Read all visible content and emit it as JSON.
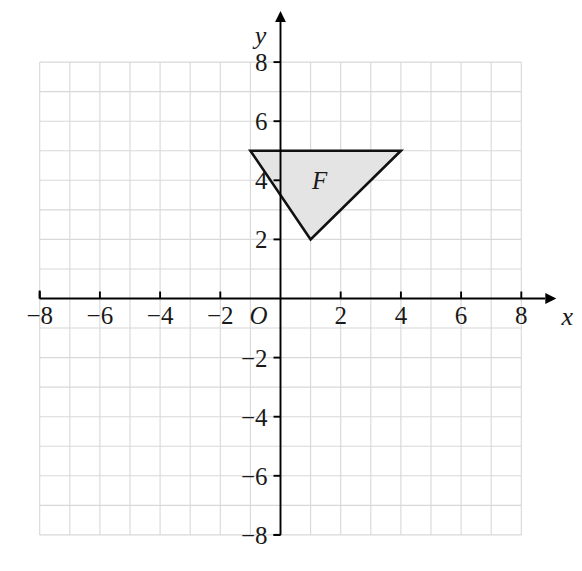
{
  "figure": {
    "title": "",
    "background_color": "#ffffff"
  },
  "chart_data": {
    "type": "scatter",
    "subtype": "coordinate-plane-polygon",
    "title": "",
    "xlabel": "x",
    "ylabel": "y",
    "origin_label": "O",
    "xlim": [
      -8,
      8
    ],
    "ylim": [
      -8,
      8
    ],
    "grid": true,
    "grid_step": 1,
    "grid_color": "#d8d8d8",
    "axis_color": "#000000",
    "tick_step": 2,
    "x_ticks": [
      -8,
      -6,
      -4,
      -2,
      2,
      4,
      6,
      8
    ],
    "y_ticks": [
      -8,
      -6,
      -4,
      -2,
      2,
      4,
      6,
      8
    ],
    "x_tick_labels": [
      "−8",
      "−6",
      "−4",
      "−2",
      "2",
      "4",
      "6",
      "8"
    ],
    "y_tick_labels": [
      "−8",
      "−6",
      "−4",
      "−2",
      "2",
      "4",
      "6",
      "8"
    ],
    "legend": null,
    "shapes": [
      {
        "name": "F",
        "label": "F",
        "type": "triangle",
        "vertices": [
          [
            -1,
            5
          ],
          [
            4,
            5
          ],
          [
            1,
            2
          ]
        ],
        "label_position": [
          1.3,
          3.7
        ],
        "fill": "#e4e4e4",
        "stroke": "#111111",
        "stroke_width": 2.6
      }
    ]
  }
}
